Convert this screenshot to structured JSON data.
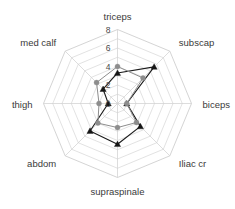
{
  "chart_data": {
    "type": "radar",
    "title": "",
    "subtitle": "",
    "xlabel": "",
    "ylabel": "",
    "grid": true,
    "legend_position": "none",
    "rlim": [
      0,
      8
    ],
    "rticks": [
      0,
      2,
      4,
      6,
      8
    ],
    "rtick_labels": [
      "0",
      "2",
      "4",
      "6",
      "8"
    ],
    "categories": [
      "triceps",
      "subscap",
      "biceps",
      "Iliac cr",
      "supraspinale",
      "abdom",
      "thigh",
      "med calf"
    ],
    "series": [
      {
        "name": "series-dark",
        "color": "#151515",
        "marker": "triangle",
        "values": [
          3.3,
          5.6,
          1.0,
          3.5,
          4.4,
          4.2,
          1.0,
          2.2
        ]
      },
      {
        "name": "series-gray",
        "color": "#8d8d8d",
        "marker": "circle",
        "values": [
          4.0,
          3.9,
          1.0,
          2.9,
          2.6,
          3.0,
          2.0,
          3.2
        ]
      }
    ]
  },
  "axis_labels": {
    "triceps": "triceps",
    "subscap": "subscap",
    "biceps": "biceps",
    "iliac_cr": "Iliac cr",
    "supraspinale": "supraspinale",
    "abdom": "abdom",
    "thigh": "thigh",
    "med_calf": "med calf"
  },
  "tick_labels": {
    "t0": "0",
    "t2": "2",
    "t4": "4",
    "t6": "6",
    "t8": "8"
  },
  "colors": {
    "background": "#ffffff",
    "grid": "#d5d5d5",
    "spoke": "#cfcfcf",
    "series_dark": "#151515",
    "series_gray": "#8d8d8d",
    "text": "#3a3a3a"
  }
}
